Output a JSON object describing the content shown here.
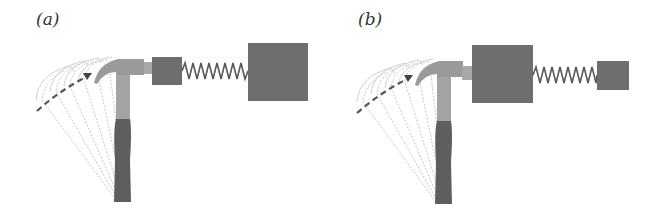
{
  "figure": {
    "panels": [
      {
        "id": "a",
        "label": "(a)",
        "description": "Hammer strikes small mass connected by spring to large mass",
        "hammer_side_mass": "small",
        "far_side_mass": "large"
      },
      {
        "id": "b",
        "label": "(b)",
        "description": "Hammer strikes large mass connected by spring to small mass",
        "hammer_side_mass": "large",
        "far_side_mass": "small"
      }
    ],
    "colors": {
      "mass": "#6e6e6e",
      "hammer_head": "#9a9a9a",
      "handle_grip": "#5e5e5e",
      "spring": "#5a5a5a",
      "ghost_lines": "#b0b0b0",
      "swing_arrow": "#555555",
      "label": "#333333"
    }
  }
}
